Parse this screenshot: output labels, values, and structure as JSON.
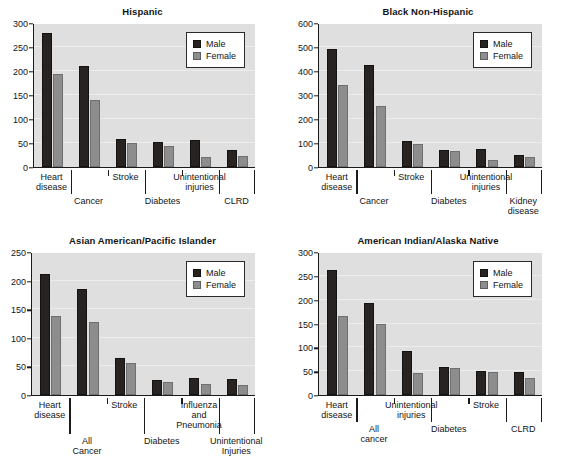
{
  "legend": {
    "male": "Male",
    "female": "Female"
  },
  "colors": {
    "male": "#272320",
    "female": "#8d8d8d",
    "plot_bg": "#dfdfdf",
    "axis": "#1b1b1b",
    "page_bg": "#ffffff"
  },
  "chart_data": [
    {
      "id": "hispanic",
      "type": "bar",
      "title": "Hispanic",
      "xlabel": "",
      "ylabel": "",
      "ylim": [
        0,
        300
      ],
      "yticks": [
        0,
        50,
        100,
        150,
        200,
        250,
        300
      ],
      "grid": false,
      "legend_position": "top-right",
      "categories": [
        "Heart disease",
        "Cancer",
        "Stroke",
        "Diabetes",
        "Unintentional injuries",
        "CLRD"
      ],
      "category_lines": [
        [
          "Heart",
          "disease"
        ],
        [
          "Cancer"
        ],
        [
          "Stroke"
        ],
        [
          "Diabetes"
        ],
        [
          "Unintentional",
          "injuries"
        ],
        [
          "CLRD"
        ]
      ],
      "label_rows": [
        "top",
        "bottom",
        "top",
        "bottom",
        "top",
        "bottom"
      ],
      "series": [
        {
          "name": "Male",
          "values": [
            280,
            211,
            59,
            52,
            57,
            36
          ]
        },
        {
          "name": "Female",
          "values": [
            193,
            140,
            51,
            44,
            20,
            23
          ]
        }
      ]
    },
    {
      "id": "black-non-hispanic",
      "type": "bar",
      "title": "Black Non-Hispanic",
      "xlabel": "",
      "ylabel": "",
      "ylim": [
        0,
        600
      ],
      "yticks": [
        0,
        100,
        200,
        300,
        400,
        500,
        600
      ],
      "grid": false,
      "legend_position": "top-right",
      "categories": [
        "Heart disease",
        "Cancer",
        "Stroke",
        "Diabetes",
        "Unintentional injuries",
        "Kidney disease"
      ],
      "category_lines": [
        [
          "Heart",
          "disease"
        ],
        [
          "Cancer"
        ],
        [
          "Stroke"
        ],
        [
          "Diabetes"
        ],
        [
          "Unintentional",
          "injuries"
        ],
        [
          "Kidney",
          "disease"
        ]
      ],
      "label_rows": [
        "top",
        "bottom",
        "top",
        "bottom",
        "top",
        "bottom"
      ],
      "series": [
        {
          "name": "Male",
          "values": [
            490,
            427,
            108,
            72,
            73,
            52
          ]
        },
        {
          "name": "Female",
          "values": [
            342,
            253,
            96,
            67,
            31,
            41
          ]
        }
      ]
    },
    {
      "id": "asian-american-pacific-islander",
      "type": "bar",
      "title": "Asian American/Pacific Islander",
      "xlabel": "",
      "ylabel": "",
      "ylim": [
        0,
        250
      ],
      "yticks": [
        0,
        50,
        100,
        150,
        200,
        250
      ],
      "grid": false,
      "legend_position": "top-right",
      "categories": [
        "Heart disease",
        "All Cancer",
        "Stroke",
        "Diabetes",
        "Influenza and Pneumonia",
        "Unintentional Injuries"
      ],
      "category_lines": [
        [
          "Heart",
          "disease"
        ],
        [
          "All",
          "Cancer"
        ],
        [
          "Stroke"
        ],
        [
          "Diabetes"
        ],
        [
          "Influenza",
          "and",
          "Pneumonia"
        ],
        [
          "Unintentional",
          "Injuries"
        ]
      ],
      "label_rows": [
        "top",
        "bottom",
        "top",
        "bottom",
        "top",
        "bottom"
      ],
      "series": [
        {
          "name": "Male",
          "values": [
            212,
            185,
            64,
            26,
            30,
            28
          ]
        },
        {
          "name": "Female",
          "values": [
            138,
            127,
            56,
            22,
            19,
            17
          ]
        }
      ]
    },
    {
      "id": "american-indian-alaska-native",
      "type": "bar",
      "title": "American Indian/Alaska Native",
      "xlabel": "",
      "ylabel": "",
      "ylim": [
        0,
        300
      ],
      "yticks": [
        0,
        50,
        100,
        150,
        200,
        250,
        300
      ],
      "grid": false,
      "legend_position": "top-right",
      "categories": [
        "Heart disease",
        "All cancer",
        "Unintentional injuries",
        "Diabetes",
        "Stroke",
        "CLRD"
      ],
      "category_lines": [
        [
          "Heart",
          "disease"
        ],
        [
          "All",
          "cancer"
        ],
        [
          "Unintentional",
          "injuries"
        ],
        [
          "Diabetes"
        ],
        [
          "Stroke"
        ],
        [
          "CLRD"
        ]
      ],
      "label_rows": [
        "top",
        "bottom",
        "top",
        "bottom",
        "top",
        "bottom"
      ],
      "series": [
        {
          "name": "Male",
          "values": [
            263,
            193,
            93,
            59,
            50,
            49
          ]
        },
        {
          "name": "Female",
          "values": [
            166,
            148,
            46,
            57,
            49,
            36
          ]
        }
      ]
    }
  ]
}
